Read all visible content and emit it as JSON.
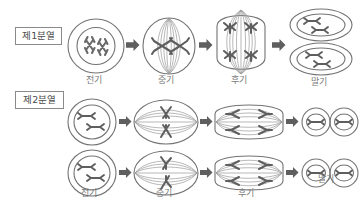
{
  "diagram": {
    "language": "ko",
    "background_color": "#ffffff",
    "ink_color": "#6b6b6b",
    "arrow_color": "#5a5a5a",
    "rows": [
      {
        "id": "division-1",
        "label": "제1분열",
        "stages": [
          {
            "id": "prophase-1",
            "caption": "전기",
            "cell_shape": "circle",
            "nucleus": true,
            "spindle": false,
            "chromosome_count": 2,
            "chromosome_arrangement": "scattered-in-nucleus"
          },
          {
            "id": "metaphase-1",
            "caption": "중기",
            "cell_shape": "oval-vertical",
            "nucleus": false,
            "spindle": true,
            "chromosome_count": 2,
            "chromosome_arrangement": "equator-paired"
          },
          {
            "id": "anaphase-1",
            "caption": "후기",
            "cell_shape": "elongated-vertical",
            "nucleus": false,
            "spindle": true,
            "chromosome_count": 4,
            "chromosome_arrangement": "two-poles"
          },
          {
            "id": "telophase-1",
            "caption": "말기",
            "cell_shape": "two-stacked-cells",
            "nucleus": true,
            "spindle": false,
            "chromosome_count": 2,
            "chromosome_arrangement": "in-two-nuclei"
          }
        ]
      },
      {
        "id": "division-2",
        "label": "제2분열",
        "stages": [
          {
            "id": "prophase-2",
            "caption": "전기",
            "cell_shape": "circle",
            "nucleus": true,
            "spindle": false,
            "chromosome_count": 2,
            "chromosome_arrangement": "scattered-in-nucleus"
          },
          {
            "id": "metaphase-2",
            "caption": "중기",
            "cell_shape": "oval-horizontal",
            "nucleus": false,
            "spindle": true,
            "chromosome_count": 2,
            "chromosome_arrangement": "equator-stacked"
          },
          {
            "id": "anaphase-2",
            "caption": "후기",
            "cell_shape": "oval-wide",
            "nucleus": false,
            "spindle": true,
            "chromosome_count": 4,
            "chromosome_arrangement": "two-poles-horizontal"
          },
          {
            "id": "telophase-2",
            "caption": "말기",
            "cell_shape": "two-side-by-side-cells",
            "nucleus": true,
            "spindle": false,
            "chromosome_count": 2,
            "chromosome_arrangement": "in-two-nuclei"
          }
        ]
      }
    ],
    "arrow_glyph": "➡"
  }
}
